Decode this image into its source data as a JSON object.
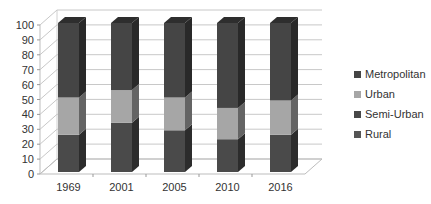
{
  "chart_data": {
    "type": "bar",
    "stacked": true,
    "percent_stacked": true,
    "style": "3d-column",
    "title": "",
    "xlabel": "",
    "ylabel": "",
    "ylim": [
      0,
      100
    ],
    "yticks": [
      "0",
      "10",
      "20",
      "30",
      "40",
      "50",
      "60",
      "70",
      "80",
      "90",
      "100"
    ],
    "categories": [
      "1969",
      "2001",
      "2005",
      "2010",
      "2016"
    ],
    "grid": true,
    "legend_position": "right",
    "series": [
      {
        "name": "Rural",
        "color": "#4a4a4a",
        "values": [
          25,
          33,
          28,
          22,
          25
        ]
      },
      {
        "name": "Semi-Urban",
        "color": "#484848",
        "values": [
          0,
          0,
          0,
          0,
          0
        ]
      },
      {
        "name": "Urban",
        "color": "#a6a6a6",
        "values": [
          25,
          22,
          22,
          21,
          23
        ]
      },
      {
        "name": "Metropolitan",
        "color": "#454545",
        "values": [
          50,
          45,
          50,
          57,
          52
        ]
      }
    ],
    "legend": [
      {
        "name": "Metropolitan",
        "color": "#454545"
      },
      {
        "name": "Urban",
        "color": "#a6a6a6"
      },
      {
        "name": "Semi-Urban",
        "color": "#484848"
      },
      {
        "name": "Rural",
        "color": "#555555"
      }
    ]
  }
}
